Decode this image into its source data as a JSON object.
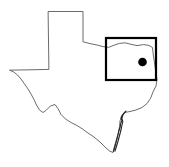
{
  "figure": {
    "type": "locator-map",
    "region_name": "Texas",
    "background_color": "#ffffff"
  },
  "state_outline": {
    "name": "texas-state-boundary",
    "stroke_color": "#5a5a5a",
    "fill_color": "#ffffff",
    "stroke_width": 0.9,
    "path": "M 48.5 11.5 L 83.0 11.5 L 83.0 41.8 L 90.0 43.6 L 97.0 45.0 L 103.0 46.6 L 108.5 47.4 L 114.0 45.2 L 119.5 43.4 L 125.0 42.8 L 131.0 44.3 L 137.0 45.6 L 143.5 44.6 L 149.0 45.4 L 152.5 47.6 L 153.2 54.0 L 154.4 62.0 L 155.6 70.5 L 157.0 79.5 L 156.0 86.0 L 153.0 92.0 L 150.5 98.5 L 147.0 103.5 L 142.0 107.5 L 136.0 110.0 L 130.0 111.5 L 124.5 112.5 L 121.5 116.0 L 120.0 121.0 L 119.5 126.5 L 118.5 132.0 L 117.0 137.5 L 115.5 143.0 L 114.0 148.0 L 113.0 152.5 L 109.5 151.0 L 105.0 147.0 L 100.0 142.0 L 94.0 137.0 L 88.0 133.0 L 82.5 129.0 L 77.0 125.5 L 71.0 122.5 L 65.5 119.0 L 61.0 114.5 L 58.0 108.5 L 55.0 104.5 L 50.5 106.0 L 46.5 110.0 L 43.0 112.5 L 39.5 110.0 L 36.5 105.0 L 34.0 99.5 L 31.0 94.0 L 28.0 89.0 L 24.5 84.0 L 21.0 79.0 L 17.5 75.0 L 13.5 71.8 L 9.5 70.2 L 18.0 70.0 L 30.0 69.8 L 40.0 69.6 L 48.5 69.4 Z"
  },
  "coast_detail": {
    "name": "gulf-coast-barrier-islands",
    "stroke_color": "#222222",
    "stroke_width": 1.1,
    "path": "M 124.8 112.2 L 122.5 115.0 L 121.2 118.0 L 122.0 120.5 L 120.8 123.0 L 120.2 127.0 L 119.0 130.5 L 118.2 134.0 L 117.2 138.0 L 116.0 142.5 L 114.8 147.0 L 113.6 151.5"
  },
  "coast_detail_2": {
    "name": "gulf-coast-bay-detail",
    "stroke_color": "#222222",
    "stroke_width": 1.1,
    "path": "M 126.0 111.0 L 123.0 114.5 L 121.8 118.5 L 122.8 121.5 L 122.0 125.0 L 121.2 129.0 L 120.2 133.0 L 119.0 137.5 L 117.8 142.0 L 116.4 146.5 L 115.0 151.0"
  },
  "inset_box": {
    "name": "study-area-inset-box",
    "stroke_color": "#000000",
    "stroke_width": 2.2,
    "x": 106.0,
    "y": 38.0,
    "width": 50.0,
    "height": 42.0
  },
  "site_marker": {
    "name": "study-site-dot",
    "fill_color": "#000000",
    "cx": 142.5,
    "cy": 62.0,
    "r": 4.3
  }
}
